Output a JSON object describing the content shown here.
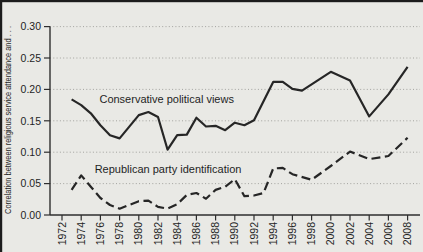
{
  "figure": {
    "background": "#e9e9e5",
    "scan_border_color": "#1c1c1c",
    "axis_color": "#2e2e2e",
    "grid_color": "#8f8f8b",
    "text_color": "#1f1f1f"
  },
  "chart_data": {
    "type": "line",
    "title": "",
    "xlabel": "",
    "ylabel": "Correlation between religious service attendance and . . .",
    "ylim": [
      0,
      0.3
    ],
    "yticks": [
      0,
      0.05,
      0.1,
      0.15,
      0.2,
      0.25,
      0.3
    ],
    "ytick_labels": [
      "0.00",
      "0.05",
      "0.10",
      "0.15",
      "0.20",
      "0.25",
      "0.30"
    ],
    "xticks": [
      1972,
      1974,
      1976,
      1978,
      1980,
      1982,
      1984,
      1986,
      1988,
      1990,
      1992,
      1994,
      1996,
      1998,
      2000,
      2002,
      2004,
      2006,
      2008
    ],
    "xlim": [
      1970.8,
      2009.6
    ],
    "grid": "dotted horizontal gridlines at each 0.05",
    "legend_position": "inline text annotations next to lines",
    "series": [
      {
        "name": "Conservative political views",
        "style": "solid",
        "color": "#262626",
        "points": [
          [
            1973,
            0.184
          ],
          [
            1974,
            0.175
          ],
          [
            1975,
            0.162
          ],
          [
            1976,
            0.143
          ],
          [
            1977,
            0.127
          ],
          [
            1978,
            0.122
          ],
          [
            1980,
            0.159
          ],
          [
            1981,
            0.164
          ],
          [
            1982,
            0.156
          ],
          [
            1983,
            0.104
          ],
          [
            1984,
            0.127
          ],
          [
            1985,
            0.128
          ],
          [
            1986,
            0.155
          ],
          [
            1987,
            0.141
          ],
          [
            1988,
            0.142
          ],
          [
            1989,
            0.135
          ],
          [
            1990,
            0.147
          ],
          [
            1991,
            0.143
          ],
          [
            1992,
            0.151
          ],
          [
            1994,
            0.212
          ],
          [
            1995,
            0.212
          ],
          [
            1996,
            0.201
          ],
          [
            1997,
            0.198
          ],
          [
            2000,
            0.228
          ],
          [
            2002,
            0.214
          ],
          [
            2004,
            0.157
          ],
          [
            2006,
            0.192
          ],
          [
            2008,
            0.236
          ]
        ]
      },
      {
        "name": "Republican party identification",
        "style": "dashed",
        "color": "#262626",
        "points": [
          [
            1973,
            0.04
          ],
          [
            1974,
            0.063
          ],
          [
            1975,
            0.045
          ],
          [
            1976,
            0.027
          ],
          [
            1977,
            0.016
          ],
          [
            1978,
            0.01
          ],
          [
            1980,
            0.022
          ],
          [
            1981,
            0.023
          ],
          [
            1982,
            0.013
          ],
          [
            1983,
            0.01
          ],
          [
            1984,
            0.017
          ],
          [
            1985,
            0.032
          ],
          [
            1986,
            0.035
          ],
          [
            1987,
            0.026
          ],
          [
            1988,
            0.04
          ],
          [
            1989,
            0.045
          ],
          [
            1990,
            0.057
          ],
          [
            1991,
            0.03
          ],
          [
            1992,
            0.031
          ],
          [
            1993,
            0.035
          ],
          [
            1994,
            0.074
          ],
          [
            1995,
            0.075
          ],
          [
            1996,
            0.065
          ],
          [
            1998,
            0.056
          ],
          [
            2000,
            0.078
          ],
          [
            2002,
            0.101
          ],
          [
            2004,
            0.089
          ],
          [
            2006,
            0.094
          ],
          [
            2008,
            0.123
          ]
        ]
      }
    ],
    "annotations": [
      {
        "text": "Conservative political views",
        "x": 1975.9,
        "y": 0.179
      },
      {
        "text": "Republican party identification",
        "x": 1975.4,
        "y": 0.067
      }
    ]
  }
}
